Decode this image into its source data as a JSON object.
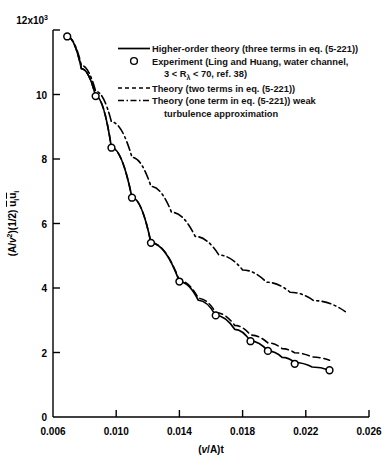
{
  "chart_data": {
    "type": "line",
    "title": "",
    "xlabel": "(v/A)t",
    "ylabel": "(A/v²)(1/2) uᵢuᵢ",
    "y_axis_multiplier": "12x10",
    "y_axis_multiplier_exp": "3",
    "xlim": [
      0.006,
      0.026
    ],
    "ylim": [
      0,
      12000
    ],
    "xticks": [
      "0.006",
      "0.010",
      "0.014",
      "0.018",
      "0.022",
      "0.026"
    ],
    "xtick_values": [
      0.006,
      0.01,
      0.014,
      0.018,
      0.022,
      0.026
    ],
    "yticks": [
      "0",
      "2",
      "4",
      "6",
      "8",
      "10",
      "12x10"
    ],
    "ytick_values": [
      0,
      2000,
      4000,
      6000,
      8000,
      10000,
      12000
    ],
    "grid": false,
    "legend_position": "upper-right",
    "series": [
      {
        "name": "higher-order-theory",
        "label": "Higher-order theory (three terms in eq. (5-221))",
        "style": "solid",
        "color": "#000000",
        "x": [
          0.0069,
          0.0078,
          0.0087,
          0.0097,
          0.011,
          0.0122,
          0.014,
          0.0152,
          0.0163,
          0.0175,
          0.0185,
          0.0196,
          0.0205,
          0.0213,
          0.0224,
          0.0235
        ],
        "y": [
          11800,
          10800,
          9950,
          8350,
          6800,
          5400,
          4200,
          3620,
          3150,
          2720,
          2350,
          2050,
          1850,
          1690,
          1550,
          1450
        ]
      },
      {
        "name": "experiment-ling-huang",
        "label": "Experiment (Ling and Huang, water channel,",
        "label_line2_pre": "3 < R",
        "label_line2_sub": "λ",
        "label_line2_post": " < 70, ref. 38)",
        "style": "markers",
        "marker": "open-circle",
        "color": "#000000",
        "x": [
          0.0069,
          0.0087,
          0.0097,
          0.011,
          0.0122,
          0.014,
          0.0163,
          0.0185,
          0.0196,
          0.0213,
          0.0235
        ],
        "y": [
          11800,
          9950,
          8350,
          6800,
          5400,
          4200,
          3150,
          2350,
          2050,
          1650,
          1450
        ]
      },
      {
        "name": "theory-two-terms",
        "label": "Theory (two terms in eq. (5-221))",
        "style": "dashed",
        "color": "#000000",
        "x": [
          0.0069,
          0.0078,
          0.0087,
          0.0097,
          0.011,
          0.0122,
          0.014,
          0.0152,
          0.0163,
          0.0175,
          0.0185,
          0.0196,
          0.0205,
          0.0213,
          0.0224,
          0.0235
        ],
        "y": [
          11800,
          10800,
          9950,
          8350,
          6800,
          5400,
          4230,
          3680,
          3240,
          2840,
          2540,
          2300,
          2120,
          1990,
          1860,
          1760
        ]
      },
      {
        "name": "theory-one-term-weak-turbulence",
        "label": "Theory (one term in eq. (5-221)) weak",
        "label_line2": "turbulence approximation",
        "style": "dash-dot",
        "color": "#000000",
        "x": [
          0.0069,
          0.0078,
          0.0087,
          0.0097,
          0.011,
          0.0122,
          0.0135,
          0.015,
          0.0165,
          0.018,
          0.0195,
          0.021,
          0.0225,
          0.0245
        ],
        "y": [
          11800,
          10900,
          10100,
          9150,
          8050,
          7150,
          6350,
          5600,
          5020,
          4560,
          4180,
          3870,
          3610,
          3270
        ]
      }
    ]
  }
}
